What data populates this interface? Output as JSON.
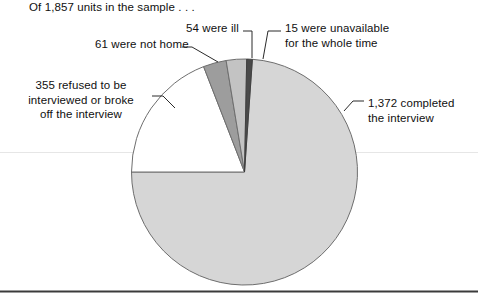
{
  "figure": {
    "caption": "Of 1,857 units in the sample . . ."
  },
  "labels": {
    "not_home": "61 were not home",
    "ill": "54 were ill",
    "unavailable_line1": "15 were unavailable",
    "unavailable_line2": "for the whole time",
    "refused_line1": "355 refused to be",
    "refused_line2": "interviewed or broke",
    "refused_line3": "off the interview",
    "completed_line1": "1,372 completed",
    "completed_line2": "the interview"
  },
  "chart_data": {
    "type": "pie",
    "title": "Of 1,857 units in the sample . . .",
    "total": 1857,
    "total_label": "1,857 units",
    "units": "units in the sample",
    "legend_position": "callout-labels",
    "grid": false,
    "categories": [
      "completed the interview",
      "refused to be interviewed or broke off the interview",
      "were not home",
      "were ill",
      "were unavailable for the whole time"
    ],
    "values": [
      1372,
      355,
      61,
      54,
      15
    ],
    "value_labels": [
      "1,372",
      "355",
      "61",
      "54",
      "15"
    ],
    "percentages": [
      73.9,
      19.1,
      3.3,
      2.9,
      0.8
    ],
    "colors": [
      "#d6d6d6",
      "#ffffff",
      "#9d9d9d",
      "#c3c3c3",
      "#4a4a4a"
    ],
    "slice_outline_color": "#6e6e6e",
    "start_angle_deg": -90,
    "direction": "counterclockwise"
  },
  "style": {
    "background": "#ffffff",
    "text_color": "#101010",
    "leader_line_color": "#2a2a2a",
    "rule_color": "#3b3b3b",
    "faint_rule_color": "#e3e3e3"
  }
}
